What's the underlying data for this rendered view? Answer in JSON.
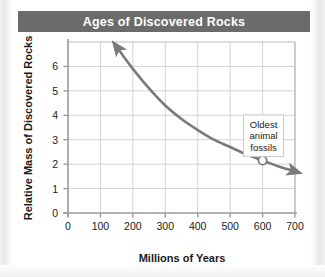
{
  "chart_data": {
    "type": "line",
    "title": "Ages of Discovered Rocks",
    "xlabel": "Millions of Years",
    "ylabel": "Relative Mass of Discovered Rocks",
    "xlim": [
      0,
      700
    ],
    "ylim": [
      0,
      7
    ],
    "xticks": [
      0,
      100,
      200,
      300,
      400,
      500,
      600,
      700
    ],
    "yticks": [
      0,
      1,
      2,
      3,
      4,
      5,
      6
    ],
    "xtick_labels": [
      "0",
      "100",
      "200",
      "300",
      "400",
      "500",
      "600",
      "700"
    ],
    "ytick_labels": [
      "0",
      "1",
      "2",
      "3",
      "4",
      "5",
      "6"
    ],
    "grid": true,
    "legend": "none",
    "series": [
      {
        "name": "Relative mass of discovered rocks",
        "line_color": "#7a7a7a",
        "arrow_start": true,
        "arrow_end": true,
        "x": [
          150,
          200,
          250,
          300,
          350,
          400,
          450,
          500,
          550,
          600,
          650,
          700
        ],
        "values": [
          6.8,
          5.9,
          5.1,
          4.4,
          3.85,
          3.4,
          3.0,
          2.7,
          2.4,
          2.15,
          1.9,
          1.7
        ]
      }
    ],
    "annotations": [
      {
        "label": "Oldest animal fossils",
        "lines": [
          "Oldest",
          "animal",
          "fossils"
        ],
        "point_x": 600,
        "point_y": 2.15,
        "marker": "open-circle"
      }
    ]
  },
  "banner": {
    "color": "#6b6b6b"
  }
}
